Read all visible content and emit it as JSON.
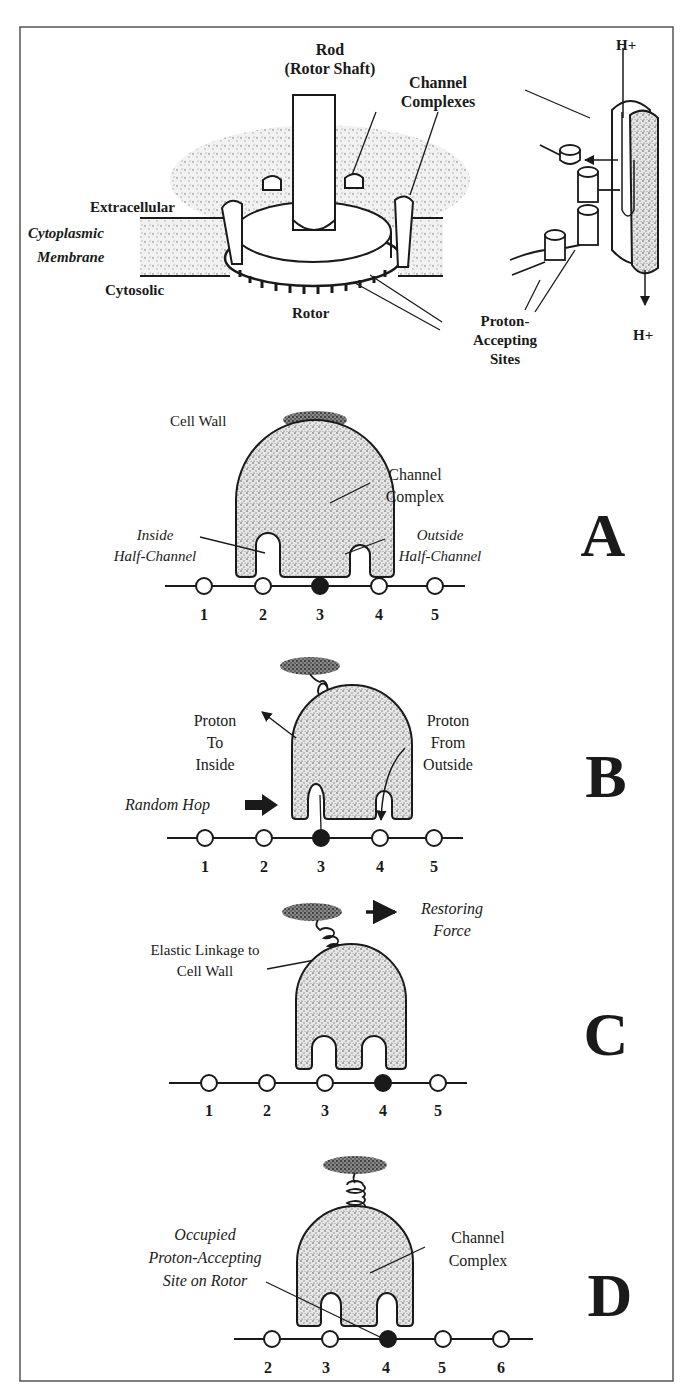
{
  "figure": {
    "top": {
      "rod_label": "Rod",
      "rod_sublabel": "(Rotor Shaft)",
      "channel_complexes_line1": "Channel",
      "channel_complexes_line2": "Complexes",
      "extracellular": "Extracellular",
      "cytoplasmic_line1": "Cytoplasmic",
      "cytoplasmic_line2": "Membrane",
      "cytosolic": "Cytosolic",
      "rotor": "Rotor",
      "proton_accepting_line1": "Proton-",
      "proton_accepting_line2": "Accepting",
      "proton_accepting_line3": "Sites",
      "h_plus_top": "H+",
      "h_plus_bottom": "H+"
    },
    "panels": [
      {
        "letter": "A",
        "cell_wall": "Cell Wall",
        "channel_line1": "Channel",
        "channel_line2": "Complex",
        "inside_line1": "Inside",
        "inside_line2": "Half-Channel",
        "outside_line1": "Outside",
        "outside_line2": "Half-Channel",
        "sites": [
          "1",
          "2",
          "3",
          "4",
          "5"
        ],
        "occupied_index": 2
      },
      {
        "letter": "B",
        "proton_to_inside_line1": "Proton",
        "proton_to_inside_line2": "To",
        "proton_to_inside_line3": "Inside",
        "proton_from_outside_line1": "Proton",
        "proton_from_outside_line2": "From",
        "proton_from_outside_line3": "Outside",
        "random_hop": "Random Hop",
        "sites": [
          "1",
          "2",
          "3",
          "4",
          "5"
        ],
        "occupied_index": 2
      },
      {
        "letter": "C",
        "restoring_line1": "Restoring",
        "restoring_line2": "Force",
        "elastic_line1": "Elastic Linkage to",
        "elastic_line2": "Cell Wall",
        "sites": [
          "1",
          "2",
          "3",
          "4",
          "5"
        ],
        "occupied_index": 3
      },
      {
        "letter": "D",
        "occupied_line1": "Occupied",
        "occupied_line2": "Proton-Accepting",
        "occupied_line3": "Site on Rotor",
        "channel_line1": "Channel",
        "channel_line2": "Complex",
        "sites": [
          "2",
          "3",
          "4",
          "5",
          "6"
        ],
        "occupied_index": 2
      }
    ]
  },
  "colors": {
    "ink": "#1a1a1a",
    "stipple": "#9a9a9a",
    "frame": "#555555",
    "background": "#ffffff"
  }
}
